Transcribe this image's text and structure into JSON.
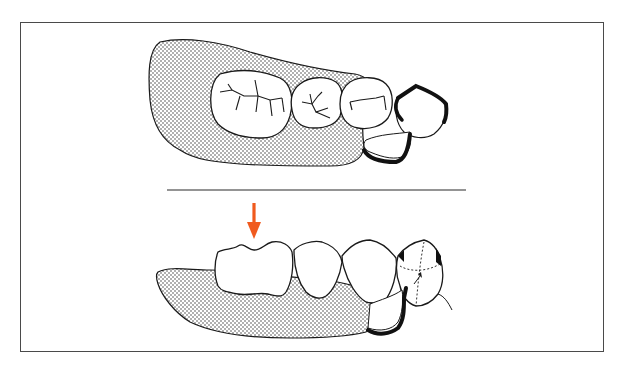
{
  "figure": {
    "description": "Dental illustration: removable partial denture shown in occlusal view (top) and lateral view (bottom), with an arrow indicating the loaded molar.",
    "colors": {
      "line": "#1a1a1a",
      "stipple_dot": "#3a3a3a",
      "frame": "#4a4a4a",
      "arrow": "#f05a1e",
      "background": "#ffffff"
    },
    "panels": [
      {
        "id": "occlusal-view",
        "label": "Occlusal view of denture base with molar, premolars and clasp on abutment tooth"
      },
      {
        "id": "lateral-view",
        "label": "Lateral view of denture base with molar, premolars, clasp arm and abutment tooth"
      }
    ],
    "separator": {
      "x1": 167,
      "x2": 466,
      "y": 190
    },
    "arrow": {
      "direction": "down",
      "label": "occlusal force indicator"
    }
  }
}
